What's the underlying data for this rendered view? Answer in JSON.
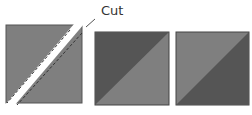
{
  "diagram": {
    "label": "Cut",
    "colors": {
      "light": "#7f7f7f",
      "dark": "#555555",
      "border": "#444444"
    },
    "squares": [
      {
        "name": "cut-square",
        "top": "light",
        "bottom": "light"
      },
      {
        "name": "half-triangle-square-a",
        "top": "dark",
        "bottom": "light"
      },
      {
        "name": "half-triangle-square-b",
        "top": "light",
        "bottom": "dark"
      }
    ]
  }
}
